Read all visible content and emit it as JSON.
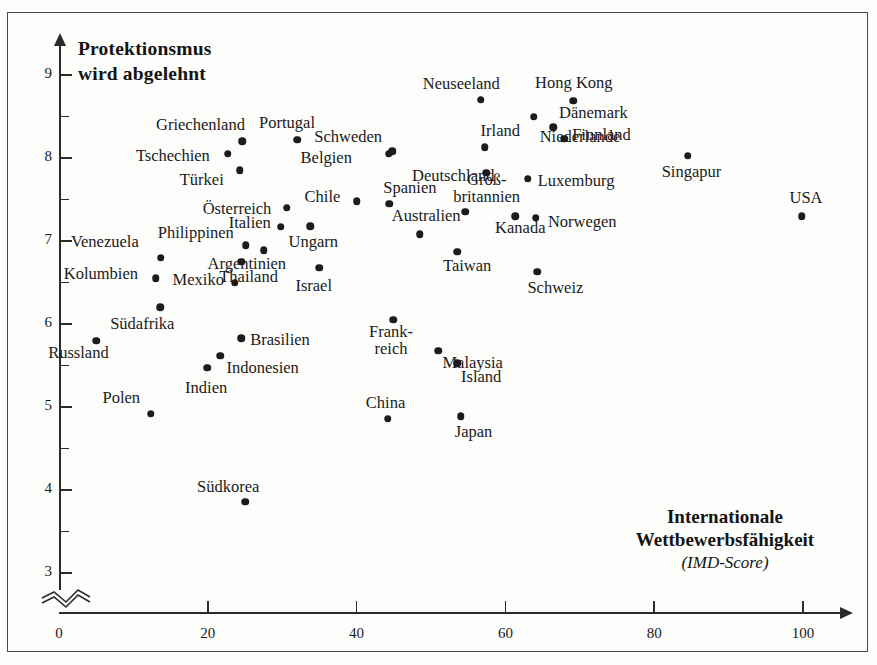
{
  "chart_data": {
    "type": "scatter",
    "title": "",
    "ylabel": "Protektionsmus\nwird abgelehnt",
    "ylabel_line1": "Protektionsmus",
    "ylabel_line2": "wird abgelehnt",
    "xlabel_line1": "Internationale",
    "xlabel_line2": "Wettbewerbsfähigkeit",
    "xlabel_sub": "(IMD-Score)",
    "xlim": [
      0,
      105
    ],
    "ylim": [
      2.7,
      9.3
    ],
    "xticks": [
      0,
      20,
      40,
      60,
      80,
      100
    ],
    "yticks": [
      3,
      4,
      5,
      6,
      7,
      8,
      9
    ],
    "y_axis_break": true,
    "grid": false,
    "legend": null,
    "point_color": "#1c1c1c",
    "points": [
      {
        "label": "Russland",
        "x": 5,
        "y": 5.8,
        "lx": -48,
        "ly": 12
      },
      {
        "label": "Kolumbien",
        "x": 13,
        "y": 6.55,
        "lx": -92,
        "ly": -4
      },
      {
        "label": "Venezuela",
        "x": 13.7,
        "y": 6.8,
        "lx": -90,
        "ly": -16
      },
      {
        "label": "Südafrika",
        "x": 13.6,
        "y": 6.2,
        "lx": -50,
        "ly": 17
      },
      {
        "label": "Polen",
        "x": 12.3,
        "y": 4.92,
        "lx": -48,
        "ly": -16
      },
      {
        "label": "Tschechien",
        "x": 22.7,
        "y": 8.05,
        "lx": -92,
        "ly": 2
      },
      {
        "label": "Griechenland",
        "x": 24.6,
        "y": 8.2,
        "lx": -86,
        "ly": -16
      },
      {
        "label": "Türkei",
        "x": 24.3,
        "y": 7.85,
        "lx": -60,
        "ly": 10
      },
      {
        "label": "Indien",
        "x": 19.9,
        "y": 5.47,
        "lx": -22,
        "ly": 20
      },
      {
        "label": "Indonesien",
        "x": 21.7,
        "y": 5.62,
        "lx": 6,
        "ly": 12
      },
      {
        "label": "Brasilien",
        "x": 24.5,
        "y": 5.83,
        "lx": 9,
        "ly": 2
      },
      {
        "label": "Mexiko",
        "x": 23.6,
        "y": 6.5,
        "lx": -62,
        "ly": -3
      },
      {
        "label": "Thailand",
        "x": 24.5,
        "y": 6.75,
        "lx": -22,
        "ly": 15
      },
      {
        "label": "Südkorea",
        "x": 25,
        "y": 3.86,
        "lx": -48,
        "ly": -15
      },
      {
        "label": "Philippinen",
        "x": 25.1,
        "y": 6.95,
        "lx": -88,
        "ly": -12
      },
      {
        "label": "Argentinien",
        "x": 27.5,
        "y": 6.89,
        "lx": -56,
        "ly": 14
      },
      {
        "label": "Italien",
        "x": 29.8,
        "y": 7.17,
        "lx": -52,
        "ly": -4
      },
      {
        "label": "Österreich",
        "x": 30.6,
        "y": 7.4,
        "lx": -84,
        "ly": 1
      },
      {
        "label": "Portugal",
        "x": 32,
        "y": 8.22,
        "lx": -38,
        "ly": -17
      },
      {
        "label": "Ungarn",
        "x": 33.8,
        "y": 7.18,
        "lx": -22,
        "ly": 16
      },
      {
        "label": "Israel",
        "x": 35,
        "y": 6.68,
        "lx": -24,
        "ly": 18
      },
      {
        "label": "Chile",
        "x": 40,
        "y": 7.48,
        "lx": -52,
        "ly": -4
      },
      {
        "label": "China",
        "x": 44.2,
        "y": 4.86,
        "lx": -22,
        "ly": -16
      },
      {
        "label": "Spanien",
        "x": 44.4,
        "y": 7.45,
        "lx": -6,
        "ly": -16
      },
      {
        "label": "Schweden",
        "x": 44.8,
        "y": 8.08,
        "lx": -78,
        "ly": -14
      },
      {
        "label": "Frankreich",
        "x": 44.9,
        "y": 6.05,
        "lx": -24,
        "ly": 12
      },
      {
        "label": "Belgien",
        "x": 44.3,
        "y": 8.05,
        "lx": -88,
        "ly": 4
      },
      {
        "label": "Australien",
        "x": 48.5,
        "y": 7.08,
        "lx": -28,
        "ly": -18
      },
      {
        "label": "Malaysia",
        "x": 51,
        "y": 5.68,
        "lx": 4,
        "ly": 12
      },
      {
        "label": "Japan",
        "x": 54,
        "y": 4.89,
        "lx": -6,
        "ly": 16
      },
      {
        "label": "Island",
        "x": 53.5,
        "y": 5.53,
        "lx": 4,
        "ly": 14
      },
      {
        "label": "Taiwan",
        "x": 53.5,
        "y": 6.87,
        "lx": -14,
        "ly": 14
      },
      {
        "label": "Neuseeland",
        "x": 56.7,
        "y": 8.7,
        "lx": -58,
        "ly": -16
      },
      {
        "label": "Irland",
        "x": 57.2,
        "y": 8.13,
        "lx": -4,
        "ly": -16
      },
      {
        "label": "Deutschland",
        "x": 57.4,
        "y": 7.82,
        "lx": -74,
        "ly": 3
      },
      {
        "label": "Großbritannien",
        "x": 54.6,
        "y": 7.35,
        "lx": -12,
        "ly": -32
      },
      {
        "label": "Kanada",
        "x": 61.3,
        "y": 7.3,
        "lx": -20,
        "ly": 12
      },
      {
        "label": "Dänemark",
        "x": 66.4,
        "y": 8.37,
        "lx": 6,
        "ly": -14
      },
      {
        "label": "Hong Kong",
        "x": 69.1,
        "y": 8.69,
        "lx": -38,
        "ly": -18
      },
      {
        "label": "Finnland",
        "x": 67.9,
        "y": 8.23,
        "lx": 8,
        "ly": -4
      },
      {
        "label": "Niederlande",
        "x": 63.8,
        "y": 8.5,
        "lx": 6,
        "ly": 20
      },
      {
        "label": "Luxemburg",
        "x": 63,
        "y": 7.75,
        "lx": 10,
        "ly": 2
      },
      {
        "label": "Norwegen",
        "x": 64.1,
        "y": 7.28,
        "lx": 12,
        "ly": 4
      },
      {
        "label": "Schweiz",
        "x": 64.3,
        "y": 6.63,
        "lx": -10,
        "ly": 16
      },
      {
        "label": "Singapur",
        "x": 84.5,
        "y": 8.03,
        "lx": -26,
        "ly": 16
      },
      {
        "label": "USA",
        "x": 99.8,
        "y": 7.3,
        "lx": -12,
        "ly": -18
      }
    ]
  },
  "labels_multiline": {
    "Großbritannien": [
      "Groß-",
      "britannien"
    ],
    "Frankreich": [
      "Frank-",
      "reich"
    ]
  }
}
